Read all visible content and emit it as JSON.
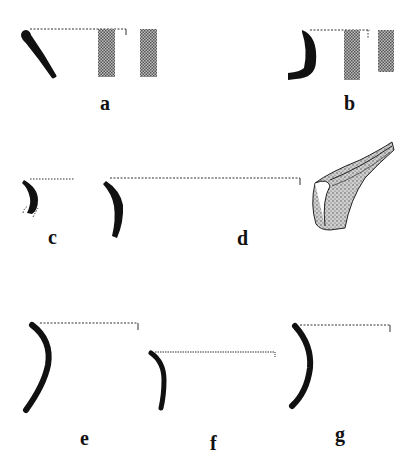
{
  "figure": {
    "type": "pottery rim profile drawings",
    "colors": {
      "ink": "#111111",
      "hatch": "#8a8a8a",
      "stipple": "#6a6a6a"
    },
    "sherds": [
      {
        "id": "a",
        "label": "a",
        "has_section_bars": true
      },
      {
        "id": "b",
        "label": "b",
        "has_section_bars": true
      },
      {
        "id": "c",
        "label": "c",
        "has_section_bars": false
      },
      {
        "id": "d",
        "label": "d",
        "has_section_bars": false,
        "has_perspective_drawing": true
      },
      {
        "id": "e",
        "label": "e",
        "has_section_bars": false
      },
      {
        "id": "f",
        "label": "f",
        "has_section_bars": false
      },
      {
        "id": "g",
        "label": "g",
        "has_section_bars": false
      }
    ]
  }
}
